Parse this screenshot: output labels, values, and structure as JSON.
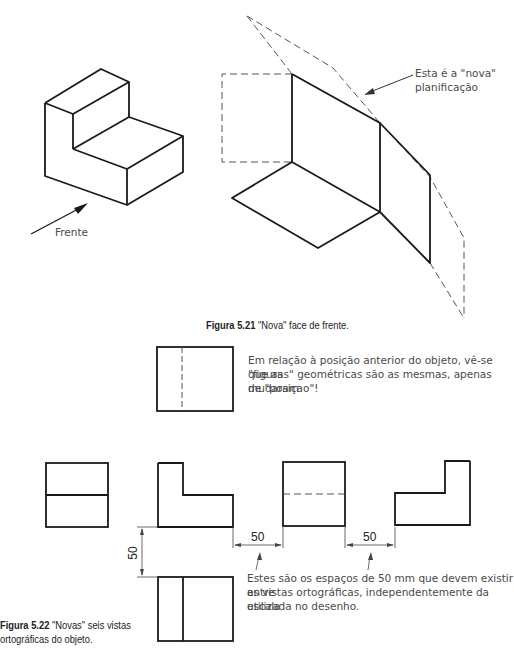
{
  "figure_5_21": {
    "label_frente": "Frente",
    "annotation_line1": "Esta é a \"nova\"",
    "annotation_line2": "planificação",
    "caption_number": "Figura 5.21",
    "caption_text": " \"Nova\" face de frente."
  },
  "note_top": {
    "line1": "Em relação à posição anterior do objeto, vê-se que as",
    "line2": "\"figuras\" geométricas são as mesmas, apenas mudaram",
    "line3": "de \"posiçao\"!"
  },
  "figure_5_22": {
    "dim_horizontal_1": "50",
    "dim_horizontal_2": "50",
    "dim_vertical": "50",
    "note_line1": "Estes são os espaços de 50 mm que devem existir entre",
    "note_line2": "as vistas ortográficas, independentemente da escala",
    "note_line3": "utilizada no desenho.",
    "caption_number": "Figura 5.22",
    "caption_text_line1": " \"Novas\" seis vistas",
    "caption_text_line2": "ortográficas do objeto."
  },
  "colors": {
    "line": "#1a1a1a",
    "hidden_line": "#555555",
    "text": "#4a4a4a"
  }
}
